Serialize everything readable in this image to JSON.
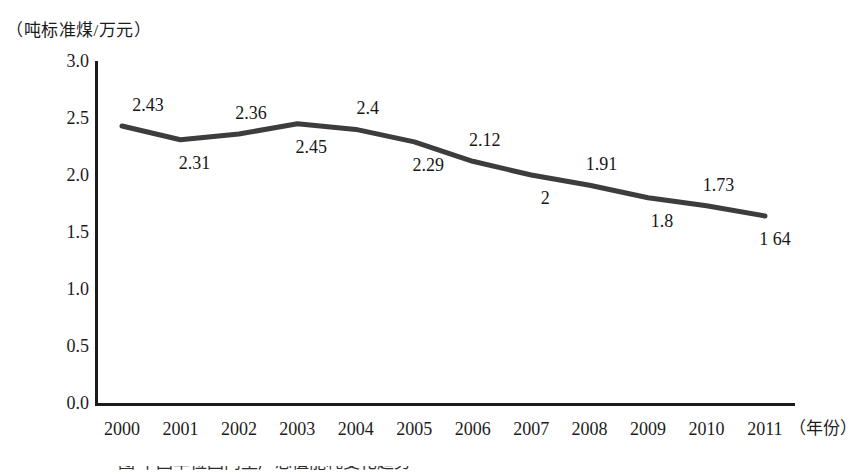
{
  "chart_data": {
    "type": "line",
    "title": "",
    "xlabel": "年份",
    "ylabel": "吨标准煤/万元",
    "y_unit_label": "（吨标准煤/万元）",
    "x_unit_label": "（年份）",
    "categories": [
      "2000",
      "2001",
      "2002",
      "2003",
      "2004",
      "2005",
      "2006",
      "2007",
      "2008",
      "2009",
      "2010",
      "2011"
    ],
    "values": [
      2.43,
      2.31,
      2.36,
      2.45,
      2.4,
      2.29,
      2.12,
      2,
      1.91,
      1.8,
      1.73,
      1.64
    ],
    "point_labels": [
      "2.43",
      "2.31",
      "2.36",
      "2.45",
      "2.4",
      "2.29",
      "2.12",
      "2",
      "1.91",
      "1.8",
      "1.73",
      "1 64"
    ],
    "label_positions": [
      "above",
      "below",
      "above",
      "below",
      "above",
      "below",
      "above",
      "below",
      "above",
      "below",
      "above",
      "below"
    ],
    "ylim": [
      0.0,
      3.0
    ],
    "ytick_labels": [
      "3.0",
      "2.5",
      "2.0",
      "1.5",
      "1.0",
      "0.5",
      "0.0"
    ],
    "ytick_values": [
      3.0,
      2.5,
      2.0,
      1.5,
      1.0,
      0.5,
      0.0
    ],
    "grid": false,
    "legend": "none",
    "markers": false,
    "series_color": "#3d3d3d",
    "axis_color": "#1b1b1b"
  },
  "bottom_caption": {
    "text": "图           中国单位国内生产总值能耗变化趋势"
  }
}
